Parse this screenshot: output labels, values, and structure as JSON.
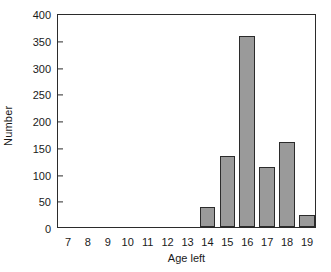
{
  "chart_data": {
    "type": "bar",
    "title": "",
    "xlabel": "Age left",
    "ylabel": "Number",
    "categories": [
      "7",
      "8",
      "9",
      "10",
      "11",
      "12",
      "13",
      "14",
      "15",
      "16",
      "17",
      "18",
      "19"
    ],
    "values": [
      0,
      0,
      0,
      0,
      0,
      0,
      0,
      37,
      133,
      357,
      112,
      159,
      22
    ],
    "xlim": [
      6.5,
      19.5
    ],
    "ylim": [
      0,
      400
    ],
    "yticks": [
      0,
      50,
      100,
      150,
      200,
      250,
      300,
      350,
      400
    ],
    "ytick_labels": [
      "0",
      "50",
      "100",
      "150",
      "200",
      "250",
      "300",
      "350",
      "400"
    ],
    "xtick_labels": [
      "7",
      "8",
      "9",
      "10",
      "11",
      "12",
      "13",
      "14",
      "15",
      "16",
      "17",
      "18",
      "19"
    ],
    "grid": false,
    "legend": null,
    "bar_fill_color": "#9a9a9a",
    "bar_edge_color": "#2b2b2b",
    "axis_color": "#2b2b2b",
    "background_color": "#ffffff"
  }
}
